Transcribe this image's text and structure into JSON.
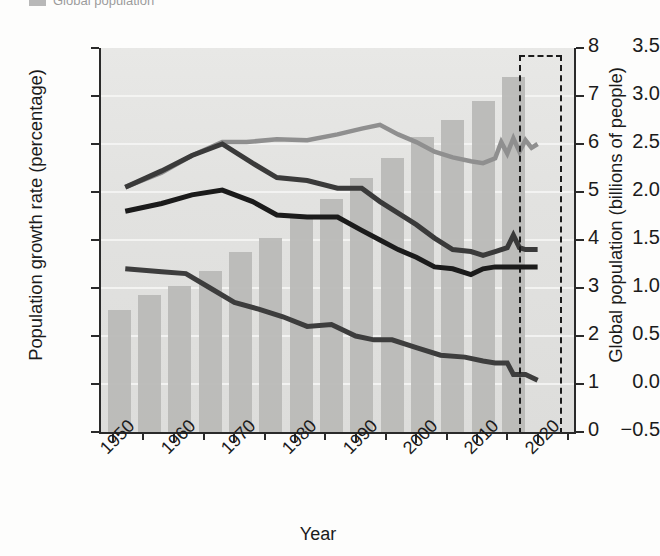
{
  "legend": {
    "swatch_color": "#b8b8b8",
    "label": "Global population"
  },
  "axes": {
    "left_title": "Population growth rate (percentage)",
    "right_title": "Global population (billions of people)",
    "x_title": "Year",
    "left_ticks": [
      "3.5",
      "3.0",
      "2.5",
      "2.0",
      "1.5",
      "1.0",
      "0.5",
      "0.0",
      "−0.5"
    ],
    "left_tick_values": [
      3.5,
      3.0,
      2.5,
      2.0,
      1.5,
      1.0,
      0.5,
      0.0,
      -0.5
    ],
    "right_ticks": [
      "8",
      "7",
      "6",
      "5",
      "4",
      "3",
      "2",
      "1",
      "0"
    ],
    "right_tick_values": [
      8,
      7,
      6,
      5,
      4,
      3,
      2,
      1,
      0
    ],
    "x_ticks": [
      "1950",
      "1960",
      "1970",
      "1980",
      "1990",
      "2000",
      "2010",
      "2020"
    ],
    "x_tick_values": [
      1950,
      1960,
      1970,
      1980,
      1990,
      2000,
      2010,
      2020
    ]
  },
  "chart_data": {
    "type": "bar",
    "title": "",
    "subtitle": "",
    "xlabel": "Year",
    "ylabel": "Population growth rate (percentage)",
    "ylabel_secondary": "Global population (billions of people)",
    "xlim": [
      1948,
      2026
    ],
    "ylim": [
      -0.5,
      3.5
    ],
    "ylim_secondary": [
      0,
      8
    ],
    "grid": "horizontal",
    "legend_position": "top-left",
    "projection_region": {
      "label": "projection",
      "x_start": 2017,
      "x_end": 2024,
      "style": "dashed-box"
    },
    "bars": {
      "name": "Global population",
      "axis": "secondary",
      "color": "#b9b9b7",
      "x": [
        1951,
        1956,
        1961,
        1966,
        1971,
        1976,
        1981,
        1986,
        1991,
        1996,
        2001,
        2006,
        2011,
        2016
      ],
      "values": [
        2.55,
        2.85,
        3.05,
        3.35,
        3.75,
        4.05,
        4.45,
        4.85,
        5.3,
        5.7,
        6.15,
        6.5,
        6.9,
        7.4
      ]
    },
    "series": [
      {
        "name": "line-light-gray",
        "axis": "primary",
        "color": "#8f8f8f",
        "x": [
          1952,
          1958,
          1963,
          1968,
          1972,
          1977,
          1982,
          1987,
          1991,
          1994,
          1997,
          2000,
          2003,
          2006,
          2009,
          2011,
          2013,
          2014,
          2015,
          2016,
          2017,
          2018,
          2019,
          2020
        ],
        "values": [
          2.05,
          2.2,
          2.38,
          2.52,
          2.52,
          2.55,
          2.54,
          2.6,
          2.66,
          2.7,
          2.6,
          2.52,
          2.42,
          2.36,
          2.32,
          2.3,
          2.35,
          2.52,
          2.4,
          2.56,
          2.42,
          2.54,
          2.46,
          2.5
        ]
      },
      {
        "name": "line-dark-gray",
        "axis": "primary",
        "color": "#3a3a3a",
        "x": [
          1952,
          1958,
          1963,
          1968,
          1973,
          1977,
          1982,
          1987,
          1991,
          1994,
          1997,
          2000,
          2003,
          2006,
          2009,
          2011,
          2013,
          2015,
          2016,
          2017,
          2018,
          2020
        ],
        "values": [
          2.05,
          2.22,
          2.38,
          2.5,
          2.3,
          2.15,
          2.12,
          2.04,
          2.04,
          1.9,
          1.78,
          1.66,
          1.52,
          1.4,
          1.38,
          1.34,
          1.38,
          1.42,
          1.55,
          1.42,
          1.4,
          1.4
        ]
      },
      {
        "name": "line-black",
        "axis": "primary",
        "color": "#1b1b1b",
        "x": [
          1952,
          1958,
          1963,
          1968,
          1973,
          1977,
          1982,
          1987,
          1991,
          1994,
          1997,
          2000,
          2003,
          2006,
          2009,
          2011,
          2013,
          2016,
          2018,
          2020
        ],
        "values": [
          1.8,
          1.88,
          1.97,
          2.02,
          1.9,
          1.76,
          1.74,
          1.74,
          1.6,
          1.5,
          1.4,
          1.32,
          1.22,
          1.2,
          1.14,
          1.2,
          1.22,
          1.22,
          1.22,
          1.22
        ]
      },
      {
        "name": "line-bottom-dark",
        "axis": "primary",
        "color": "#3d3d3d",
        "x": [
          1952,
          1958,
          1962,
          1966,
          1970,
          1974,
          1978,
          1982,
          1986,
          1990,
          1993,
          1996,
          2000,
          2004,
          2008,
          2011,
          2013,
          2015,
          2016,
          2018,
          2020
        ],
        "values": [
          1.2,
          1.17,
          1.15,
          1.0,
          0.85,
          0.78,
          0.7,
          0.6,
          0.62,
          0.5,
          0.46,
          0.46,
          0.38,
          0.3,
          0.28,
          0.24,
          0.22,
          0.22,
          0.1,
          0.1,
          0.04
        ]
      }
    ]
  }
}
